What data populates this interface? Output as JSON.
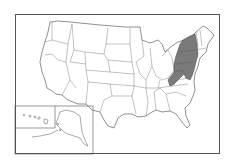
{
  "map": {
    "title": "",
    "highlight_color": "#7a7a7a",
    "base_color": "#ffffff",
    "stroke_color": "#444444",
    "highlighted_states": [
      "New York",
      "Pennsylvania",
      "New Jersey",
      "Delaware",
      "Maryland",
      "West Virginia"
    ],
    "insets": [
      "Alaska",
      "Hawaii"
    ]
  }
}
